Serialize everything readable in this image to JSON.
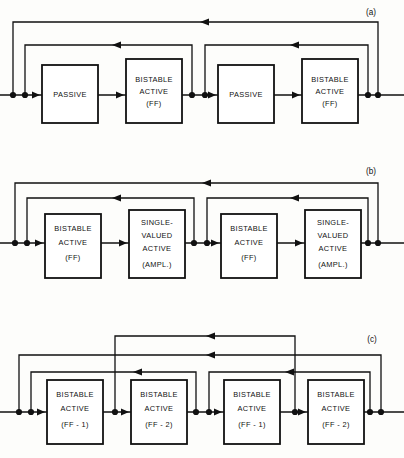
{
  "figure": {
    "background_color": "#fdfdfb",
    "line_color": "#111111",
    "box_fill": "#ffffff",
    "width": 404,
    "height": 458
  },
  "panels": [
    {
      "id": "a",
      "label": "(a)",
      "label_x": 371,
      "label_y": 15,
      "baseline_y": 95,
      "blocks": [
        {
          "id": "a1",
          "x": 42,
          "y": 65,
          "w": 56,
          "h": 58,
          "lines": [
            "PASSIVE"
          ]
        },
        {
          "id": "a2",
          "x": 126,
          "y": 59,
          "w": 56,
          "h": 64,
          "lines": [
            "BISTABLE",
            "ACTIVE",
            "(FF)"
          ]
        },
        {
          "id": "a3",
          "x": 218,
          "y": 65,
          "w": 56,
          "h": 58,
          "lines": [
            "PASSIVE"
          ]
        },
        {
          "id": "a4",
          "x": 302,
          "y": 59,
          "w": 56,
          "h": 64,
          "lines": [
            "BISTABLE",
            "ACTIVE",
            "(FF)"
          ]
        }
      ],
      "feedback_loops": [
        {
          "id": "a-outer",
          "from_x": 378,
          "to_x": 13,
          "y": 22,
          "arrow_x": 200
        },
        {
          "id": "a-inner-1",
          "from_x": 192,
          "to_x": 25,
          "y": 45,
          "arrow_x": 112
        },
        {
          "id": "a-inner-2",
          "from_x": 368,
          "to_x": 205,
          "y": 45,
          "arrow_x": 290
        }
      ],
      "junction_dots": [
        {
          "x": 13,
          "y": 95
        },
        {
          "x": 25,
          "y": 95
        },
        {
          "x": 192,
          "y": 95
        },
        {
          "x": 205,
          "y": 95
        },
        {
          "x": 368,
          "y": 95
        },
        {
          "x": 378,
          "y": 95
        }
      ]
    },
    {
      "id": "b",
      "label": "(b)",
      "label_x": 371,
      "label_y": 174,
      "baseline_y": 243,
      "blocks": [
        {
          "id": "b1",
          "x": 45,
          "y": 214,
          "w": 56,
          "h": 64,
          "lines": [
            "BISTABLE",
            "ACTIVE",
            "(FF)"
          ]
        },
        {
          "id": "b2",
          "x": 129,
          "y": 210,
          "w": 56,
          "h": 68,
          "lines": [
            "SINGLE-",
            "VALUED",
            "ACTIVE",
            "(AMPL.)"
          ]
        },
        {
          "id": "b3",
          "x": 221,
          "y": 214,
          "w": 56,
          "h": 64,
          "lines": [
            "BISTABLE",
            "ACTIVE",
            "(FF)"
          ]
        },
        {
          "id": "b4",
          "x": 305,
          "y": 210,
          "w": 56,
          "h": 68,
          "lines": [
            "SINGLE-",
            "VALUED",
            "ACTIVE",
            "(AMPL.)"
          ]
        }
      ],
      "feedback_loops": [
        {
          "id": "b-outer",
          "from_x": 378,
          "to_x": 15,
          "y": 183,
          "arrow_x": 202
        },
        {
          "id": "b-inner-1",
          "from_x": 194,
          "to_x": 27,
          "y": 198,
          "arrow_x": 112
        },
        {
          "id": "b-inner-2",
          "from_x": 368,
          "to_x": 207,
          "y": 198,
          "arrow_x": 290
        }
      ],
      "junction_dots": [
        {
          "x": 15,
          "y": 243
        },
        {
          "x": 27,
          "y": 243
        },
        {
          "x": 194,
          "y": 243
        },
        {
          "x": 207,
          "y": 243
        },
        {
          "x": 368,
          "y": 243
        },
        {
          "x": 378,
          "y": 243
        }
      ]
    },
    {
      "id": "c",
      "label": "(c)",
      "label_x": 372,
      "label_y": 342,
      "baseline_y": 412,
      "blocks": [
        {
          "id": "c1",
          "x": 47,
          "y": 380,
          "w": 56,
          "h": 64,
          "lines": [
            "BISTABLE",
            "ACTIVE",
            "(FF - 1)"
          ]
        },
        {
          "id": "c2",
          "x": 131,
          "y": 380,
          "w": 56,
          "h": 64,
          "lines": [
            "BISTABLE",
            "ACTIVE",
            "(FF - 2)"
          ]
        },
        {
          "id": "c3",
          "x": 224,
          "y": 380,
          "w": 56,
          "h": 64,
          "lines": [
            "BISTABLE",
            "ACTIVE",
            "(FF - 1)"
          ]
        },
        {
          "id": "c4",
          "x": 308,
          "y": 380,
          "w": 56,
          "h": 64,
          "lines": [
            "BISTABLE",
            "ACTIVE",
            "(FF - 2)"
          ]
        }
      ],
      "feedback_loops": [
        {
          "id": "c-cross",
          "from_x": 295,
          "to_x": 115,
          "y": 336,
          "arrow_x": 206
        },
        {
          "id": "c-outer",
          "from_x": 381,
          "to_x": 19,
          "y": 355,
          "arrow_x": 206
        },
        {
          "id": "c-inner-1",
          "from_x": 196,
          "to_x": 31,
          "y": 372,
          "arrow_x": 133
        },
        {
          "id": "c-inner-2",
          "from_x": 370,
          "to_x": 209,
          "y": 372,
          "arrow_x": 285
        }
      ],
      "junction_dots": [
        {
          "x": 19,
          "y": 412
        },
        {
          "x": 31,
          "y": 412
        },
        {
          "x": 115,
          "y": 412
        },
        {
          "x": 196,
          "y": 412
        },
        {
          "x": 209,
          "y": 412
        },
        {
          "x": 295,
          "y": 412
        },
        {
          "x": 370,
          "y": 412
        },
        {
          "x": 381,
          "y": 412
        }
      ]
    }
  ]
}
